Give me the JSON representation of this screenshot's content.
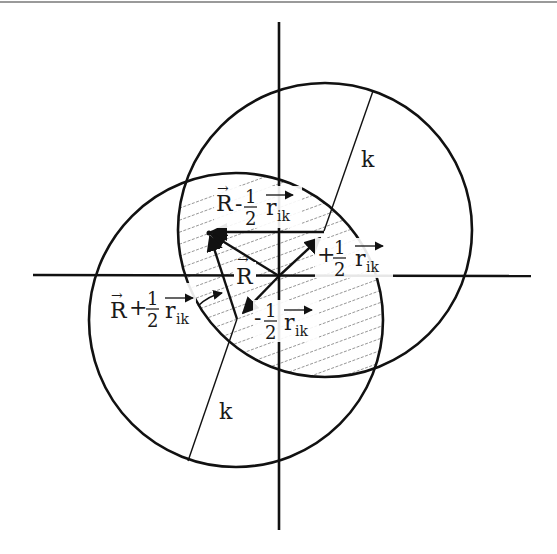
{
  "diagram": {
    "type": "geometry",
    "colors": {
      "stroke": "#111111",
      "hatch": "#8a8a8a",
      "top_border": "#9a9a9a",
      "background": "#ffffff"
    },
    "axes": {
      "origin": [
        279,
        276
      ],
      "horizontal": {
        "x1": 33,
        "x2": 531,
        "y": 275
      },
      "vertical": {
        "x": 279,
        "y1": 22,
        "y2": 530
      }
    },
    "circles": [
      {
        "id": "upper-circle",
        "cx": 325,
        "cy": 230,
        "r": 147
      },
      {
        "id": "lower-circle",
        "cx": 236,
        "cy": 320,
        "r": 147
      }
    ],
    "radius_lines": [
      {
        "id": "upper-radius",
        "x1": 324,
        "y1": 231,
        "x2": 373,
        "y2": 91,
        "label": "k",
        "label_pos": [
          363,
          168
        ]
      },
      {
        "id": "lower-radius",
        "x1": 237,
        "y1": 319,
        "x2": 188,
        "y2": 461,
        "label": "k",
        "label_pos": [
          220,
          420
        ]
      }
    ],
    "vectors": [
      {
        "id": "vector-R",
        "x1": 279,
        "y1": 276,
        "x2": 209,
        "y2": 233,
        "arrow": "end"
      },
      {
        "id": "vector-plus-half-r",
        "x1": 279,
        "y1": 276,
        "x2": 321,
        "y2": 237,
        "arrow": "end"
      },
      {
        "id": "vector-minus-half-r",
        "x1": 279,
        "y1": 276,
        "x2": 242,
        "y2": 314,
        "arrow": "end"
      },
      {
        "id": "line-R-to-upper-center",
        "x1": 209,
        "y1": 232,
        "x2": 324,
        "y2": 232,
        "arrow": "start"
      },
      {
        "id": "line-R-to-lower-center",
        "x1": 237,
        "y1": 319,
        "x2": 209,
        "y2": 233,
        "arrow": "end"
      }
    ],
    "labels": {
      "R": "R",
      "minus": "-",
      "plus": "+",
      "one": "1",
      "two": "2",
      "r": "r",
      "ik": "ik",
      "k": "k",
      "arrow_glyph": "→"
    }
  }
}
